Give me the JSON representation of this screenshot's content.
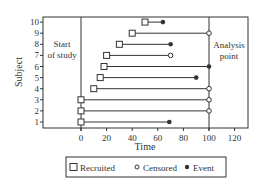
{
  "chart_data": {
    "type": "scatter",
    "subtype": "swimmer-plot",
    "title": "",
    "xlabel": "Time",
    "ylabel": "Subject",
    "xlim": [
      -20,
      130
    ],
    "ylim": [
      0.5,
      10.5
    ],
    "x_ticks": [
      0,
      20,
      40,
      60,
      80,
      100,
      120
    ],
    "y_ticks": [
      1,
      2,
      3,
      4,
      5,
      6,
      7,
      8,
      9,
      10
    ],
    "grid": false,
    "vertical_lines": [
      {
        "x": 0,
        "label": "Start of study"
      },
      {
        "x": 100,
        "label": "Analysis point"
      }
    ],
    "annotations": {
      "start": [
        "Start",
        "of study"
      ],
      "analysis": [
        "Analysis",
        "point"
      ]
    },
    "subjects": [
      {
        "subject": 1,
        "recruited": 0,
        "end": 69,
        "outcome": "Event"
      },
      {
        "subject": 2,
        "recruited": 0,
        "end": 100,
        "outcome": "Censored"
      },
      {
        "subject": 3,
        "recruited": 0,
        "end": 100,
        "outcome": "Censored"
      },
      {
        "subject": 4,
        "recruited": 10,
        "end": 100,
        "outcome": "Censored"
      },
      {
        "subject": 5,
        "recruited": 15,
        "end": 90,
        "outcome": "Event"
      },
      {
        "subject": 6,
        "recruited": 18,
        "end": 100,
        "outcome": "Event"
      },
      {
        "subject": 7,
        "recruited": 20,
        "end": 70,
        "outcome": "Censored"
      },
      {
        "subject": 8,
        "recruited": 30,
        "end": 70,
        "outcome": "Event"
      },
      {
        "subject": 9,
        "recruited": 40,
        "end": 100,
        "outcome": "Censored"
      },
      {
        "subject": 10,
        "recruited": 50,
        "end": 64,
        "outcome": "Event"
      }
    ],
    "legend": {
      "position": "bottom",
      "entries": [
        {
          "label": "Recruited",
          "marker": "open-square"
        },
        {
          "label": "Censored",
          "marker": "open-circle"
        },
        {
          "label": "Event",
          "marker": "filled-circle"
        }
      ]
    }
  },
  "colors": {
    "line": "#333333",
    "background": "#ffffff"
  }
}
